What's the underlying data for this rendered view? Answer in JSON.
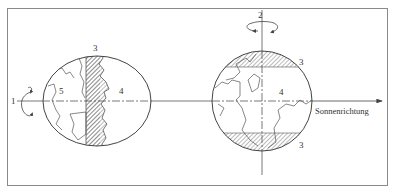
{
  "figure": {
    "caption_direction": "Sonnenrichtung",
    "left_globe": {
      "axis_label": "1",
      "zone_labels": {
        "twilight": "3",
        "day": "4",
        "night": "5"
      }
    },
    "right_globe": {
      "axis_label": "2",
      "zone_labels": {
        "twilight_top": "3",
        "day": "4",
        "twilight_bottom": "3"
      }
    }
  },
  "colors": {
    "stroke": "#555555",
    "frame": "#8a8a8a",
    "text": "#333333",
    "background": "#ffffff"
  }
}
